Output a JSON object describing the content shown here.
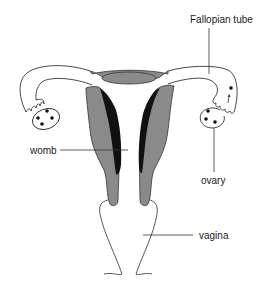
{
  "diagram": {
    "type": "anatomical-diagram",
    "labels": [
      {
        "id": "fallopian_tube",
        "text": "Fallopian tube"
      },
      {
        "id": "womb",
        "text": "womb"
      },
      {
        "id": "ovary",
        "text": "ovary"
      },
      {
        "id": "vagina",
        "text": "vagina"
      }
    ],
    "colors": {
      "wall_gray": "#8a8a8a",
      "lining_black": "#111111",
      "outline": "#333333",
      "background": "#ffffff"
    }
  }
}
